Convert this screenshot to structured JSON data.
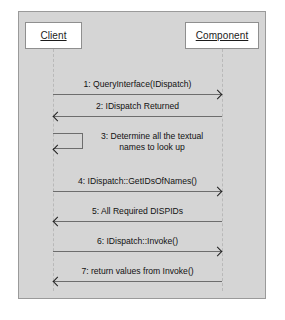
{
  "diagram": {
    "type": "uml-sequence-diagram",
    "background_color": "#d5d5d5",
    "frame_border_color": "#9a9a9a",
    "line_color": "#6d6d6d",
    "text_color": "#111111",
    "participant_fill": "#ffffff"
  },
  "participants": [
    {
      "id": "client",
      "label": "Client"
    },
    {
      "id": "component",
      "label": "Component"
    }
  ],
  "messages": [
    {
      "number": "1",
      "label": "1: QueryInterface(IDispatch)",
      "direction": "right",
      "kind": "call"
    },
    {
      "number": "2",
      "label": "2: IDispatch Returned",
      "direction": "left",
      "kind": "return"
    },
    {
      "number": "3",
      "label": "3: Determine all the textual names to look up",
      "line1": "3: Determine all the textual",
      "line2": "names to look up",
      "direction": "self",
      "kind": "self-call"
    },
    {
      "number": "4",
      "label": "4: IDispatch::GetIDsOfNames()",
      "direction": "right",
      "kind": "call"
    },
    {
      "number": "5",
      "label": "5: All Required DISPIDs",
      "direction": "left",
      "kind": "return"
    },
    {
      "number": "6",
      "label": "6: IDispatch::Invoke()",
      "direction": "right",
      "kind": "call"
    },
    {
      "number": "7",
      "label": "7: return values from Invoke()",
      "direction": "left",
      "kind": "return"
    }
  ]
}
